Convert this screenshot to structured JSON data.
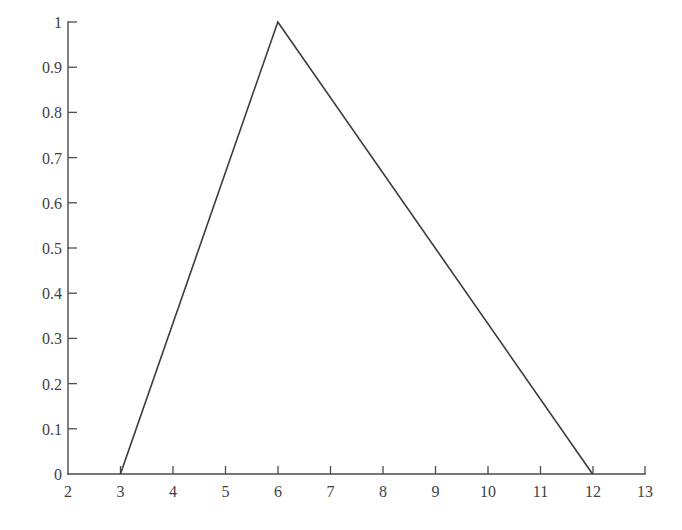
{
  "chart_data": {
    "type": "line",
    "title": "",
    "subtitle": "",
    "xlabel": "",
    "ylabel": "",
    "xlim": [
      2,
      13
    ],
    "ylim": [
      0,
      1
    ],
    "grid": false,
    "legend": null,
    "legend_position": "none",
    "xticks": [
      2,
      3,
      4,
      5,
      6,
      7,
      8,
      9,
      10,
      11,
      12,
      13
    ],
    "xtick_labels": [
      "2",
      "3",
      "4",
      "5",
      "6",
      "7",
      "8",
      "9",
      "10",
      "11",
      "12",
      "13"
    ],
    "yticks": [
      0,
      0.1,
      0.2,
      0.3,
      0.4,
      0.5,
      0.6,
      0.7,
      0.8,
      0.9,
      1
    ],
    "ytick_labels": [
      "0",
      "0.1",
      "0.2",
      "0.3",
      "0.4",
      "0.5",
      "0.6",
      "0.7",
      "0.8",
      "0.9",
      "1"
    ],
    "series": [
      {
        "name": "triangular membership function",
        "x": [
          3,
          6,
          12
        ],
        "values": [
          0,
          1,
          0
        ],
        "color": "#3c3c3c"
      }
    ],
    "annotations": []
  },
  "figure": {
    "background_color": "#ffffff",
    "axis_color": "#4a4a4a",
    "line_color": "#3c3c3c",
    "text_color": "#3f3f3f"
  }
}
